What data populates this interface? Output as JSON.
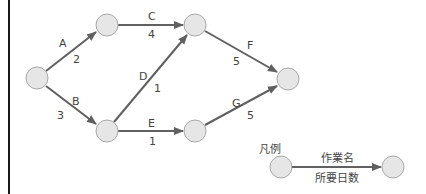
{
  "diagram": {
    "type": "activity-network",
    "colors": {
      "border": "#1a1a1a",
      "edge": "#606060",
      "node_fill": "#e6e6e6",
      "node_stroke": "#a8a8a8",
      "text": "#444444"
    },
    "nodes": [
      {
        "id": "n1",
        "x": 37,
        "y": 78
      },
      {
        "id": "n2",
        "x": 107,
        "y": 25
      },
      {
        "id": "n3",
        "x": 195,
        "y": 25
      },
      {
        "id": "n4",
        "x": 107,
        "y": 131
      },
      {
        "id": "n5",
        "x": 195,
        "y": 131
      },
      {
        "id": "n6",
        "x": 288,
        "y": 79
      }
    ],
    "edges": [
      {
        "from": "n1",
        "to": "n2",
        "task": "A",
        "days": "2"
      },
      {
        "from": "n1",
        "to": "n4",
        "task": "B",
        "days": "3"
      },
      {
        "from": "n2",
        "to": "n3",
        "task": "C",
        "days": "4"
      },
      {
        "from": "n4",
        "to": "n3",
        "task": "D",
        "days": "1"
      },
      {
        "from": "n4",
        "to": "n5",
        "task": "E",
        "days": "1"
      },
      {
        "from": "n3",
        "to": "n6",
        "task": "F",
        "days": "5"
      },
      {
        "from": "n5",
        "to": "n6",
        "task": "G",
        "days": "5"
      }
    ],
    "legend": {
      "title": "凡例",
      "task_label": "作業名",
      "days_label": "所要日数"
    }
  }
}
